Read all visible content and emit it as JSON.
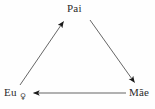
{
  "diagram": {
    "type": "cycle-triangle",
    "background_color": "#fefefe",
    "line_color": "#4a4a4a",
    "text_color": "#2b2b2b",
    "nodes": [
      {
        "id": "pai",
        "label": "Pai",
        "position": "top"
      },
      {
        "id": "eu",
        "label": "Eu",
        "annotation": "♀",
        "position": "bottom-left"
      },
      {
        "id": "mae",
        "label": "Mãe",
        "position": "bottom-right"
      }
    ],
    "edges": [
      {
        "id": "eu-to-pai",
        "from": "Eu",
        "to": "Pai",
        "arrow": "to"
      },
      {
        "id": "pai-to-mae",
        "from": "Pai",
        "to": "Mãe",
        "arrow": "to"
      },
      {
        "id": "mae-to-eu",
        "from": "Mãe",
        "to": "Eu",
        "arrow": "to"
      }
    ]
  }
}
